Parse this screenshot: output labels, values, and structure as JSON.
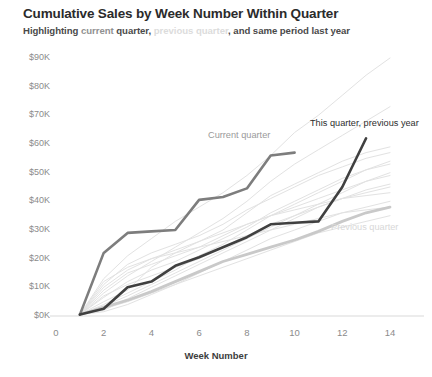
{
  "header": {
    "title": "Cumulative Sales by Week Number Within Quarter",
    "subtitle_parts": [
      {
        "text": "Highlighting ",
        "style": "plain"
      },
      {
        "text": "current",
        "style": "current"
      },
      {
        "text": " quarter, ",
        "style": "plain"
      },
      {
        "text": "previous quarter",
        "style": "previous"
      },
      {
        "text": ", and same period last year",
        "style": "plain"
      }
    ],
    "subtitle_full": "Highlighting current quarter, previous quarter, and same period last year"
  },
  "colors": {
    "current_quarter": "#7d7d7d",
    "this_quarter_previous_year": "#404040",
    "previous_quarter": "#c9c9c9",
    "background_series": "#e2e2e2",
    "axis": "#d9d9d9",
    "tick_label": "#8b8b8b",
    "title": "#2b2b2b"
  },
  "annotations": [
    {
      "name": "current-quarter",
      "label": "Current quarter",
      "x": 208,
      "y": 130,
      "style": "current"
    },
    {
      "name": "this-quarter-previous-year",
      "label": "This quarter, previous year",
      "x": 310,
      "y": 118,
      "style": "prevyear"
    },
    {
      "name": "previous-quarter",
      "label": "Previous quarter",
      "x": 331,
      "y": 222,
      "style": "previous"
    }
  ],
  "chart_data": {
    "type": "line",
    "title": "Cumulative Sales by Week Number Within Quarter",
    "subtitle": "Highlighting current quarter, previous quarter, and same period last year",
    "xlabel": "Week Number",
    "ylabel": "",
    "xlim": [
      0,
      14.6
    ],
    "ylim": [
      0,
      93
    ],
    "xticks": [
      0,
      2,
      4,
      6,
      8,
      10,
      12,
      14
    ],
    "xticklabels": [
      "0",
      "2",
      "4",
      "6",
      "8",
      "10",
      "12",
      "14"
    ],
    "yticks": [
      0,
      10,
      20,
      30,
      40,
      50,
      60,
      70,
      80,
      90
    ],
    "yticklabels": [
      "$0K",
      "$10K",
      "$20K",
      "$30K",
      "$40K",
      "$50K",
      "$60K",
      "$70K",
      "$80K",
      "$90K"
    ],
    "y_unit": "thousands of dollars",
    "grid": false,
    "legend": "annotations-inline",
    "x": [
      1,
      2,
      3,
      4,
      5,
      6,
      7,
      8,
      9,
      10,
      11,
      12,
      13,
      14
    ],
    "series": [
      {
        "name": "Current quarter",
        "emphasis": "highlight",
        "color": "#7d7d7d",
        "width": 2.6,
        "values": [
          0.5,
          22.0,
          29.0,
          29.5,
          30.0,
          40.5,
          41.5,
          44.5,
          56.0,
          57.0,
          null,
          null,
          null,
          null
        ]
      },
      {
        "name": "This quarter, previous year",
        "emphasis": "highlight",
        "color": "#404040",
        "width": 2.6,
        "values": [
          0.5,
          2.5,
          10.0,
          12.0,
          17.5,
          20.5,
          24.0,
          27.5,
          32.0,
          32.5,
          33.0,
          45.0,
          62.0,
          null
        ]
      },
      {
        "name": "Previous quarter",
        "emphasis": "highlight",
        "color": "#c9c9c9",
        "width": 2.8,
        "values": [
          0.5,
          3.0,
          5.5,
          8.5,
          12.0,
          15.5,
          19.0,
          21.5,
          24.0,
          26.5,
          29.5,
          33.0,
          36.0,
          38.0
        ]
      },
      {
        "name": "Background quarter 1",
        "emphasis": "context",
        "color": "#e2e2e2",
        "width": 1,
        "values": [
          0.5,
          13.0,
          21.0,
          27.0,
          33.0,
          38.0,
          43.0,
          49.0,
          56.0,
          64.0,
          70.0,
          77.0,
          84.0,
          90.0
        ]
      },
      {
        "name": "Background quarter 2",
        "emphasis": "context",
        "color": "#e2e2e2",
        "width": 1,
        "values": [
          0.5,
          8.0,
          14.0,
          19.0,
          24.0,
          29.0,
          34.0,
          40.0,
          47.0,
          53.0,
          58.0,
          63.0,
          68.0,
          73.0
        ]
      },
      {
        "name": "Background quarter 3",
        "emphasis": "context",
        "color": "#e2e2e2",
        "width": 1,
        "values": [
          0.5,
          5.0,
          9.0,
          17.0,
          22.0,
          26.0,
          30.0,
          36.0,
          42.0,
          46.0,
          50.0,
          54.0,
          57.0,
          59.0
        ]
      },
      {
        "name": "Background quarter 4",
        "emphasis": "context",
        "color": "#e2e2e2",
        "width": 1,
        "values": [
          0.5,
          11.0,
          18.0,
          22.0,
          25.0,
          28.0,
          32.0,
          37.0,
          41.0,
          45.0,
          49.0,
          52.0,
          55.0,
          57.0
        ]
      },
      {
        "name": "Background quarter 5",
        "emphasis": "context",
        "color": "#e2e2e2",
        "width": 1,
        "values": [
          0.5,
          4.0,
          8.0,
          12.0,
          16.0,
          21.0,
          25.0,
          30.0,
          35.0,
          39.0,
          43.0,
          47.0,
          51.0,
          54.0
        ]
      },
      {
        "name": "Background quarter 6",
        "emphasis": "context",
        "color": "#e2e2e2",
        "width": 1,
        "values": [
          0.5,
          6.5,
          12.0,
          16.0,
          19.0,
          23.0,
          27.0,
          31.0,
          36.0,
          40.0,
          44.0,
          48.0,
          51.0,
          53.0
        ]
      },
      {
        "name": "Background quarter 7",
        "emphasis": "context",
        "color": "#e2e2e2",
        "width": 1,
        "values": [
          0.5,
          3.5,
          7.0,
          11.0,
          15.0,
          19.0,
          23.0,
          27.0,
          31.0,
          35.0,
          39.0,
          43.0,
          47.0,
          50.0
        ]
      },
      {
        "name": "Background quarter 8",
        "emphasis": "context",
        "color": "#e2e2e2",
        "width": 1,
        "values": [
          0.5,
          9.0,
          15.0,
          18.0,
          21.0,
          24.0,
          28.0,
          32.0,
          35.0,
          38.0,
          41.0,
          44.0,
          47.0,
          49.0
        ]
      },
      {
        "name": "Background quarter 9",
        "emphasis": "context",
        "color": "#e2e2e2",
        "width": 1,
        "values": [
          0.5,
          2.0,
          6.0,
          10.0,
          14.0,
          18.0,
          22.0,
          26.0,
          30.0,
          34.0,
          38.0,
          41.0,
          44.0,
          46.0
        ]
      },
      {
        "name": "Background quarter 10",
        "emphasis": "context",
        "color": "#e2e2e2",
        "width": 1,
        "values": [
          0.5,
          7.0,
          11.0,
          14.0,
          17.0,
          20.0,
          24.0,
          28.0,
          32.0,
          35.0,
          38.0,
          41.0,
          43.0,
          45.0
        ]
      },
      {
        "name": "Background quarter 11",
        "emphasis": "context",
        "color": "#e2e2e2",
        "width": 1,
        "values": [
          0.5,
          10.0,
          16.0,
          20.0,
          23.0,
          26.0,
          29.0,
          32.0,
          35.0,
          37.0,
          39.0,
          41.0,
          42.0,
          43.0
        ]
      },
      {
        "name": "Background quarter 12",
        "emphasis": "context",
        "color": "#e2e2e2",
        "width": 1,
        "values": [
          0.5,
          1.5,
          4.0,
          7.5,
          11.0,
          15.0,
          19.0,
          23.0,
          27.0,
          30.0,
          33.0,
          36.0,
          38.0,
          40.0
        ]
      },
      {
        "name": "Background quarter 13",
        "emphasis": "context",
        "color": "#e2e2e2",
        "width": 1,
        "values": [
          0.5,
          12.0,
          17.0,
          20.0,
          22.0,
          24.0,
          26.0,
          28.0,
          30.0,
          32.0,
          34.0,
          36.0,
          37.0,
          38.0
        ]
      },
      {
        "name": "Background quarter 14",
        "emphasis": "context",
        "color": "#e2e2e2",
        "width": 1,
        "values": [
          0.5,
          2.5,
          5.0,
          8.0,
          11.0,
          14.0,
          17.0,
          20.0,
          23.0,
          26.0,
          29.0,
          31.0,
          33.0,
          35.0
        ]
      }
    ]
  }
}
